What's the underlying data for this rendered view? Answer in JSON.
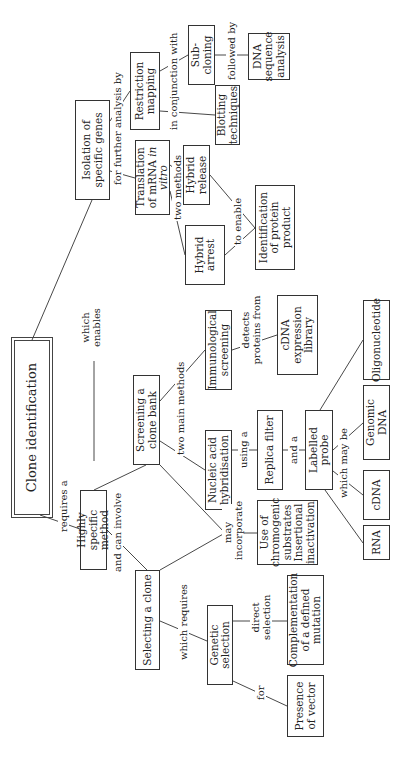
{
  "diagram": {
    "type": "concept-map",
    "orientation": "rotated-90-ccw",
    "nodes": {
      "clone_identification": "Clone identification",
      "highly_specific_method": "Highly specific method",
      "selecting_a_clone": "Selecting a clone",
      "genetic_selection": "Genetic selection",
      "presence_of_vector": "Presence of vector",
      "complementation": "Complementation of a defined mutation",
      "chromogenic": "Use of chromogenic substrates Insertional inactivation",
      "screening_clone_bank": "Screening a clone bank",
      "nucleic_acid_hybridisation": "Nucleic acid hybridisation",
      "replica_filter": "Replica filter",
      "labelled_probe": "Labelled probe",
      "rna": "RNA",
      "cdna": "cDNA",
      "genomic_dna": "Genomic DNA",
      "oligonucleotide": "Oligonucleotide",
      "immunological_screening": "Immunological screening",
      "cdna_expression_library": "cDNA expression library",
      "isolation_specific_genes": "Isolation of specific genes",
      "translation_mrna_prefix": "Translation of mRNA ",
      "translation_mrna_italic": "in vitro",
      "hybrid_arrest": "Hybrid arrest",
      "hybrid_release": "Hybrid release",
      "identification_protein": "Identification of protein product",
      "restriction_mapping": "Restriction mapping",
      "sub_cloning": "Sub-cloning",
      "blotting_techniques": "Blotting techniques",
      "dna_sequence_analysis": "DNA sequence analysis"
    },
    "links": {
      "requires_a": "requires a",
      "which_enables": "which enables",
      "and_can_involve": "and can involve",
      "which_requires": "which requires",
      "for": "for",
      "direct_selection": "direct selection",
      "may_incorporate": "may incorporate",
      "two_main_methods": "two  main methods",
      "using_a": "using a",
      "and_a": "and a",
      "which_may_be": "which may be",
      "detects_proteins_from": "detects proteins from",
      "for_further_analysis_by": "for further analysis by",
      "two_methods": "two methods",
      "to_enable": "to enable",
      "in_conjunction_with": "in conjunction with",
      "followed_by": "followed by"
    }
  }
}
